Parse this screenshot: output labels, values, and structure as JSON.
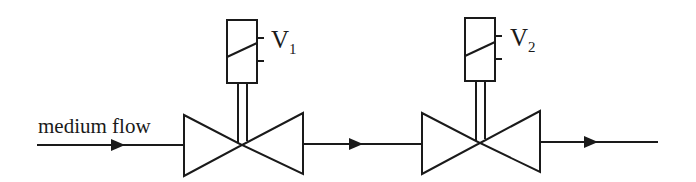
{
  "diagram": {
    "flow_label": "medium flow",
    "valves": [
      {
        "id": "V1",
        "label_main": "V",
        "label_sub": "1",
        "type": "solenoid-valve"
      },
      {
        "id": "V2",
        "label_main": "V",
        "label_sub": "2",
        "type": "solenoid-valve"
      }
    ],
    "flow_direction": "left-to-right",
    "arrows": 3,
    "colors": {
      "stroke": "#1a1a1a",
      "background": "#ffffff"
    }
  }
}
